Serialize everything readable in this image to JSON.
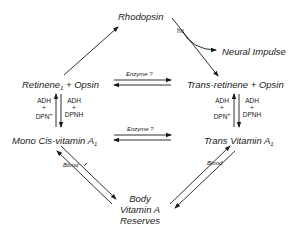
{
  "diagram": {
    "nodes": {
      "rhodopsin": "Rhodopsin",
      "neural_impulse": "Neural Impulse",
      "retinene_opsin": {
        "text": "Retinene",
        "sub": "1",
        "rest": " + Opsin"
      },
      "trans_retinene_opsin": "Trans-retinene + Opsin",
      "mono_cis_vitamin": {
        "text": "Mono Cis-vitamin A",
        "sub": "1"
      },
      "trans_vitamin": {
        "text": "Trans Vitamin A",
        "sub": "1"
      },
      "body_reserves": [
        "Body",
        "Vitamin A",
        "Reserves"
      ]
    },
    "edge_labels": {
      "hv": "hν",
      "enzyme_top": "Enzyme ?",
      "enzyme_bottom": "Enzyme ?",
      "blood_left": "Blood",
      "blood_right": "Blood"
    },
    "cofactors": {
      "left_up": {
        "line1": "ADH",
        "line2": "+",
        "line3": "DPN",
        "sup": "+"
      },
      "left_down": {
        "line1": "ADH",
        "line2": "+",
        "line3": "DPNH"
      },
      "right_up": {
        "line1": "ADH",
        "line2": "+",
        "line3": "DPN",
        "sup": "+"
      },
      "right_down": {
        "line1": "ADH",
        "line2": "+",
        "line3": "DPNH"
      }
    }
  }
}
